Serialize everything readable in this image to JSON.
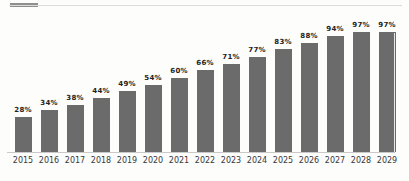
{
  "page": {
    "background": "#fdfdfc"
  },
  "decor": {
    "top_accent_color": "#8f8f8f",
    "top_rule_color": "#dcdcdc",
    "baseline_color": "#c9c9c9",
    "right_edge_line_color": "#e6e6e6"
  },
  "chart_data": {
    "type": "bar",
    "title": "",
    "xlabel": "",
    "ylabel": "",
    "categories": [
      "2015",
      "2016",
      "2017",
      "2018",
      "2019",
      "2020",
      "2021",
      "2022",
      "2023",
      "2024",
      "2025",
      "2026",
      "2027",
      "2028",
      "2029"
    ],
    "values": [
      28,
      34,
      38,
      44,
      49,
      54,
      60,
      66,
      71,
      77,
      83,
      88,
      94,
      97,
      97
    ],
    "value_labels": [
      "28%",
      "34%",
      "38%",
      "44%",
      "49%",
      "54%",
      "60%",
      "66%",
      "71%",
      "77%",
      "83%",
      "88%",
      "94%",
      "97%",
      "97%"
    ],
    "ylim": [
      0,
      100
    ],
    "grid": false,
    "legend": false,
    "bar_color": "#6b6b6b",
    "value_label_color": "#232323",
    "axis_tick_label_color": "#383838"
  }
}
